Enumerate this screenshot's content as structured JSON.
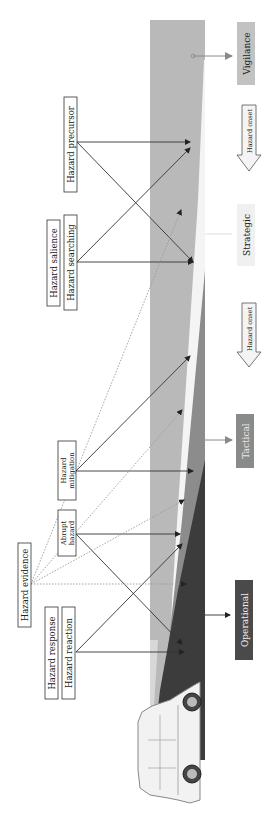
{
  "diagram": {
    "type": "hazard-perception-levels",
    "orientation": "rotated-90-ccw",
    "levels": [
      {
        "id": "vigilance",
        "label": "Vigilance",
        "color": "#c2c2c2",
        "text_color": "#222222"
      },
      {
        "id": "strategic",
        "label": "Strategic",
        "color": "#f0f0f0",
        "text_color": "#222222"
      },
      {
        "id": "tactical",
        "label": "Tactical",
        "color": "#8a8a8a",
        "text_color": "#e8e8e8"
      },
      {
        "id": "operational",
        "label": "Operational",
        "color": "#4a4a4a",
        "text_color": "#eeeeee"
      }
    ],
    "onset_arrows": [
      {
        "label": "Hazard onset"
      },
      {
        "label": "Hazard onset"
      }
    ],
    "concepts": {
      "hazard_precursor": "Hazard precursor",
      "hazard_salience": "Hazard salience",
      "hazard_searching": "Hazard searching",
      "hazard_mitigation_line1": "Hazard",
      "hazard_mitigation_line2": "mitigation",
      "abrupt_hazard_line1": "Abrupt",
      "abrupt_hazard_line2": "hazard",
      "hazard_evidence": "Hazard evidence",
      "hazard_response": "Hazard response",
      "hazard_reaction": "Hazard reaction"
    },
    "colors": {
      "band_light": "#b9b9b9",
      "band_white": "#f4f4f4",
      "band_mid": "#8c8c8c",
      "band_dark": "#3c3c3c",
      "line": "#333333",
      "dotted": "#9a9a9a"
    },
    "car_icon": "car-side-icon"
  }
}
